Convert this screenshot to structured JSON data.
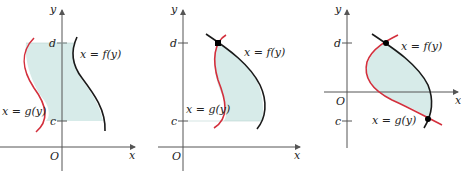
{
  "colors": {
    "region_fill": "#d7ebe9",
    "f_curve": "#1a1a1a",
    "g_curve": "#d32f3c",
    "axis": "#555555"
  },
  "panels": [
    {
      "axis_labels": {
        "x": "x",
        "y": "y",
        "origin": "O"
      },
      "tick_labels": {
        "d": "d",
        "c": "c"
      },
      "curve_labels": {
        "f": "x = f(y)",
        "g": "x = g(y)"
      }
    },
    {
      "axis_labels": {
        "x": "x",
        "y": "y",
        "origin": "O"
      },
      "tick_labels": {
        "d": "d",
        "c": "c"
      },
      "curve_labels": {
        "f": "x = f(y)",
        "g": "x = g(y)"
      }
    },
    {
      "axis_labels": {
        "x": "x",
        "y": "y",
        "origin": "O"
      },
      "tick_labels": {
        "d": "d",
        "c": "c"
      },
      "curve_labels": {
        "f": "x = f(y)",
        "g": "x = g(y)"
      }
    }
  ]
}
